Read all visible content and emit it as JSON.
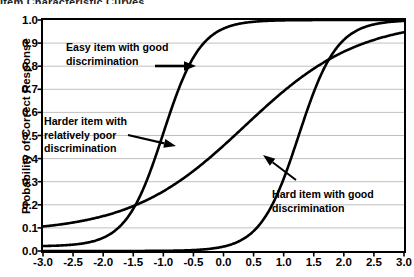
{
  "figure": {
    "title_fragment": "Item Characteristic Curves",
    "background": "#ffffff",
    "frame_color": "#000000",
    "grid_color": "#b9b9b9",
    "curve_color": "#000000"
  },
  "annotations": {
    "easy": {
      "line1": "Easy item with good",
      "line2": "discrimination",
      "arrow": "arrow-right"
    },
    "harder": {
      "line1": "Harder item with",
      "line2": "relatively poor",
      "line3": "discrimination",
      "arrow": "arrow-right"
    },
    "hard": {
      "line1": "Hard item with good",
      "line2": "discrimination",
      "arrow": "arrow-up-left"
    }
  },
  "chart_data": {
    "type": "line",
    "title": "Item Characteristic Curves",
    "xlabel": "",
    "ylabel": "Probability of Correct Response",
    "xlim": [
      -3.0,
      3.0
    ],
    "ylim": [
      0.0,
      1.0
    ],
    "grid": true,
    "legend": "none",
    "xticks": [
      "-3.0",
      "-2.5",
      "-2.0",
      "-1.5",
      "-1.0",
      "-0.5",
      "0.0",
      "0.5",
      "1.0",
      "1.5",
      "2.0",
      "2.5",
      "3.0"
    ],
    "xtick_values": [
      -3.0,
      -2.5,
      -2.0,
      -1.5,
      -1.0,
      -0.5,
      0.0,
      0.5,
      1.0,
      1.5,
      2.0,
      2.5,
      3.0
    ],
    "yticks": [
      "0.0",
      "0.1",
      "0.2",
      "0.3",
      "0.4",
      "0.5",
      "0.6",
      "0.7",
      "0.8",
      "0.9",
      "1.0"
    ],
    "ytick_values": [
      0.0,
      0.1,
      0.2,
      0.3,
      0.4,
      0.5,
      0.6,
      0.7,
      0.8,
      0.9,
      1.0
    ],
    "x": [
      -3.0,
      -2.75,
      -2.5,
      -2.25,
      -2.0,
      -1.75,
      -1.5,
      -1.25,
      -1.0,
      -0.75,
      -0.5,
      -0.25,
      0.0,
      0.25,
      0.5,
      0.75,
      1.0,
      1.25,
      1.5,
      1.75,
      2.0,
      2.25,
      2.5,
      2.75,
      3.0
    ],
    "series": [
      {
        "name": "Easy item with good discrimination",
        "model": "2PL",
        "difficulty_b": -1.0,
        "discrimination_a": 1.9,
        "guessing_c": 0.02,
        "values": [
          0.02,
          0.03,
          0.05,
          0.08,
          0.12,
          0.19,
          0.28,
          0.4,
          0.53,
          0.66,
          0.77,
          0.85,
          0.91,
          0.95,
          0.97,
          0.985,
          0.993,
          0.997,
          0.999,
          1.0,
          1.0,
          1.0,
          1.0,
          1.0,
          1.0
        ]
      },
      {
        "name": "Harder item with relatively poor discrimination",
        "model": "2PL",
        "difficulty_b": 0.35,
        "discrimination_a": 0.62,
        "guessing_c": 0.08,
        "values": [
          0.1,
          0.12,
          0.14,
          0.16,
          0.19,
          0.22,
          0.25,
          0.29,
          0.33,
          0.37,
          0.42,
          0.46,
          0.51,
          0.55,
          0.59,
          0.63,
          0.67,
          0.71,
          0.74,
          0.78,
          0.81,
          0.84,
          0.86,
          0.88,
          0.9
        ]
      },
      {
        "name": "Hard item with good discrimination",
        "model": "2PL",
        "difficulty_b": 1.25,
        "discrimination_a": 1.85,
        "guessing_c": 0.0,
        "values": [
          0.004,
          0.006,
          0.009,
          0.014,
          0.021,
          0.032,
          0.049,
          0.073,
          0.108,
          0.157,
          0.223,
          0.305,
          0.4,
          0.502,
          0.602,
          0.694,
          0.773,
          0.837,
          0.886,
          0.921,
          0.947,
          0.965,
          0.977,
          0.985,
          0.99
        ]
      }
    ],
    "crossings": [
      {
        "x": -1.6,
        "y": 0.22,
        "between": [
          "Easy item with good discrimination",
          "Harder item with relatively poor discrimination"
        ]
      },
      {
        "x": 1.5,
        "y": 0.77,
        "between": [
          "Harder item with relatively poor discrimination",
          "Hard item with good discrimination"
        ]
      }
    ]
  }
}
